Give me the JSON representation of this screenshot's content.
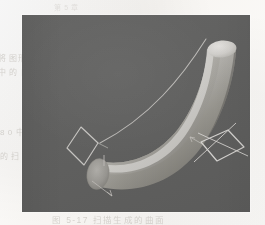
{
  "page": {
    "media": "scanned-book-page",
    "background_color": "#fbfaf8",
    "ghost_text": {
      "left_line_1": "将 图形 绘制",
      "left_line_2": "中 的 曲 面 模型",
      "left_line_3": "8 0 中",
      "left_line_4": "的 扫",
      "bottom_line": "图 5-17  扫描生成的曲面",
      "top_line": "第 5 章"
    }
  },
  "figure": {
    "viewport": {
      "x": 22,
      "y": 15,
      "width": 228,
      "height": 197,
      "background_color": "#60605f",
      "border_color": "#ffffff"
    },
    "render_style": "shaded-grayscale-3d",
    "objects": [
      {
        "name": "swept-tube",
        "type": "swept-surface",
        "description": "Cylindrical tube swept along a curved path, bending from lower-left to upper-right",
        "highlight_color": "#d8d6d2",
        "midtone_color": "#b4b2ae",
        "shadow_color": "#6e6d6a",
        "radius_px": 18
      },
      {
        "name": "tube-end-cap-start",
        "type": "ellipse-cap",
        "description": "Flat circular end cap at the lower-left terminus of the tube",
        "fill_color": "#9d9b97"
      },
      {
        "name": "tube-end-cap-end",
        "type": "rounded-cap",
        "description": "Rounded cap at the upper-right terminus of the tube",
        "fill_color": "#d2d0cc"
      },
      {
        "name": "sweep-path-curve",
        "type": "guide-curve",
        "description": "Thin wireframe rail curve defining the sweep trajectory, offset above the tube",
        "stroke_color": "#cfcdc9"
      },
      {
        "name": "profile-wireframe-left",
        "type": "cross-section-profile",
        "shape": "rhombus",
        "description": "Square cross-section profile shown in perspective at the start of the sweep path",
        "stroke_color": "#d6d4d0"
      },
      {
        "name": "profile-wireframe-right",
        "type": "cross-section-profile",
        "shape": "rotated-square-with-axes",
        "description": "Square cross-section profile with local axis cross, at the end of the sweep path",
        "stroke_color": "#e0dedb"
      },
      {
        "name": "axis-marker-start",
        "type": "direction-arrow",
        "description": "Small tangent direction arrow at the tube start",
        "stroke_color": "#c8c6c2"
      },
      {
        "name": "axis-marker-end",
        "type": "direction-arrow",
        "description": "Small tangent direction arrow near the right profile",
        "stroke_color": "#c8c6c2"
      }
    ]
  }
}
